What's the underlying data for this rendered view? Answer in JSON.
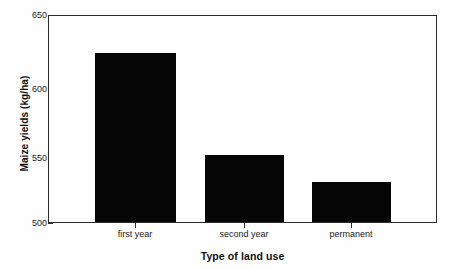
{
  "chart_data": {
    "type": "bar",
    "title": "",
    "xlabel": "Type of land use",
    "ylabel": "Maize yields (kg/ha)",
    "categories": [
      "first year",
      "second year",
      "permanent"
    ],
    "values": [
      623,
      549,
      529
    ],
    "ylim": [
      500,
      650
    ],
    "yticks": [
      500,
      550,
      600,
      650
    ],
    "ytick_labels": [
      "500",
      "550",
      "600",
      "650"
    ],
    "grid": false,
    "legend": null,
    "bar_color": "#050505",
    "axis_color": "#2b2b2b",
    "background_color": "#ffffff"
  }
}
